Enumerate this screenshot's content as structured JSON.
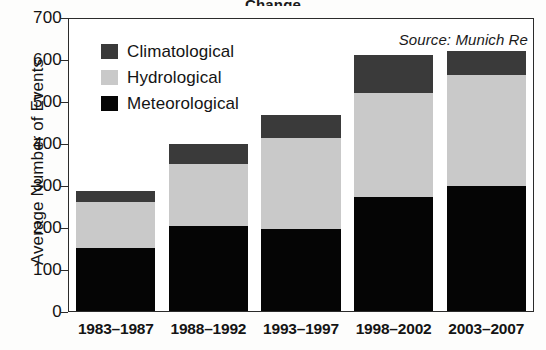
{
  "figure": {
    "cropped_title_fragment": "Change",
    "source_note": "Source: Munich Re"
  },
  "axes": {
    "ylabel": "Average Number of Events",
    "yticks": [
      "0",
      "100",
      "200",
      "300",
      "400",
      "500",
      "600",
      "700"
    ],
    "xticks": [
      "1983–1987",
      "1988–1992",
      "1993–1997",
      "1998–2002",
      "2003–2007"
    ]
  },
  "legend": {
    "entries": [
      {
        "label": "Climatological",
        "color": "#3a3a3a"
      },
      {
        "label": "Hydrological",
        "color": "#c9c9c9"
      },
      {
        "label": "Meteorological",
        "color": "#050505"
      }
    ]
  },
  "chart_data": {
    "type": "bar",
    "stacked": true,
    "title": "Average Number of Events",
    "subtitle": "",
    "xlabel": "",
    "ylabel": "Average Number of Events",
    "ylim": [
      0,
      700
    ],
    "ytick_step": 100,
    "grid": false,
    "legend_position": "upper-left-inside",
    "annotations": [
      "Source: Munich Re"
    ],
    "categories": [
      "1983–1987",
      "1988–1992",
      "1993–1997",
      "1998–2002",
      "2003–2007"
    ],
    "series": [
      {
        "name": "Meteorological",
        "color": "#050505",
        "values": [
          150,
          203,
          196,
          271,
          297
        ]
      },
      {
        "name": "Hydrological",
        "color": "#c9c9c9",
        "values": [
          110,
          147,
          216,
          249,
          265
        ]
      },
      {
        "name": "Climatological",
        "color": "#3a3a3a",
        "values": [
          25,
          47,
          55,
          90,
          56
        ]
      }
    ],
    "totals": [
      285,
      397,
      467,
      610,
      618
    ]
  }
}
